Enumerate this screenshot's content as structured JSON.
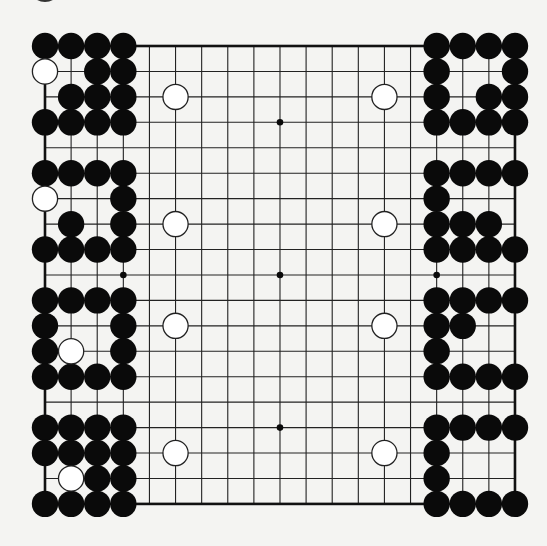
{
  "title": "Go board diagram",
  "board": {
    "size": 19,
    "background": "#f4f4f2",
    "line_color": "#222222",
    "edge_color": "#111111",
    "origin_x": 45,
    "origin_y": 46,
    "spacing_x": 26.11,
    "spacing_y": 25.44,
    "stone_radius": 13.2,
    "star_points": [
      [
        4,
        4
      ],
      [
        10,
        4
      ],
      [
        16,
        4
      ],
      [
        4,
        10
      ],
      [
        10,
        10
      ],
      [
        16,
        10
      ],
      [
        4,
        16
      ],
      [
        10,
        16
      ],
      [
        16,
        16
      ]
    ],
    "black_color": "#0a0a0a",
    "white_fill": "#ffffff",
    "white_stroke": "#222222"
  },
  "stones": {
    "black": [
      [
        1,
        1
      ],
      [
        2,
        1
      ],
      [
        3,
        1
      ],
      [
        4,
        1
      ],
      [
        3,
        2
      ],
      [
        4,
        2
      ],
      [
        2,
        3
      ],
      [
        3,
        3
      ],
      [
        4,
        3
      ],
      [
        1,
        4
      ],
      [
        2,
        4
      ],
      [
        3,
        4
      ],
      [
        4,
        4
      ],
      [
        1,
        6
      ],
      [
        2,
        6
      ],
      [
        3,
        6
      ],
      [
        4,
        6
      ],
      [
        4,
        7
      ],
      [
        2,
        8
      ],
      [
        4,
        8
      ],
      [
        1,
        9
      ],
      [
        2,
        9
      ],
      [
        3,
        9
      ],
      [
        4,
        9
      ],
      [
        1,
        11
      ],
      [
        2,
        11
      ],
      [
        3,
        11
      ],
      [
        4,
        11
      ],
      [
        1,
        12
      ],
      [
        4,
        12
      ],
      [
        1,
        13
      ],
      [
        4,
        13
      ],
      [
        1,
        14
      ],
      [
        2,
        14
      ],
      [
        3,
        14
      ],
      [
        4,
        14
      ],
      [
        1,
        16
      ],
      [
        2,
        16
      ],
      [
        3,
        16
      ],
      [
        4,
        16
      ],
      [
        1,
        17
      ],
      [
        2,
        17
      ],
      [
        3,
        17
      ],
      [
        4,
        17
      ],
      [
        3,
        18
      ],
      [
        4,
        18
      ],
      [
        1,
        19
      ],
      [
        2,
        19
      ],
      [
        3,
        19
      ],
      [
        4,
        19
      ],
      [
        16,
        1
      ],
      [
        17,
        1
      ],
      [
        18,
        1
      ],
      [
        19,
        1
      ],
      [
        16,
        2
      ],
      [
        19,
        2
      ],
      [
        16,
        3
      ],
      [
        18,
        3
      ],
      [
        19,
        3
      ],
      [
        16,
        4
      ],
      [
        17,
        4
      ],
      [
        18,
        4
      ],
      [
        19,
        4
      ],
      [
        16,
        6
      ],
      [
        17,
        6
      ],
      [
        18,
        6
      ],
      [
        19,
        6
      ],
      [
        16,
        7
      ],
      [
        16,
        8
      ],
      [
        17,
        8
      ],
      [
        18,
        8
      ],
      [
        16,
        9
      ],
      [
        17,
        9
      ],
      [
        18,
        9
      ],
      [
        19,
        9
      ],
      [
        16,
        11
      ],
      [
        17,
        11
      ],
      [
        18,
        11
      ],
      [
        19,
        11
      ],
      [
        16,
        12
      ],
      [
        17,
        12
      ],
      [
        16,
        13
      ],
      [
        16,
        14
      ],
      [
        17,
        14
      ],
      [
        18,
        14
      ],
      [
        19,
        14
      ],
      [
        16,
        16
      ],
      [
        17,
        16
      ],
      [
        18,
        16
      ],
      [
        19,
        16
      ],
      [
        16,
        17
      ],
      [
        16,
        18
      ],
      [
        16,
        19
      ],
      [
        17,
        19
      ],
      [
        18,
        19
      ],
      [
        19,
        19
      ]
    ],
    "white": [
      [
        1,
        2
      ],
      [
        1,
        7
      ],
      [
        2,
        13
      ],
      [
        2,
        18
      ],
      [
        6,
        3
      ],
      [
        14,
        3
      ],
      [
        6,
        8
      ],
      [
        14,
        8
      ],
      [
        6,
        12
      ],
      [
        14,
        12
      ],
      [
        6,
        17
      ],
      [
        14,
        17
      ]
    ]
  },
  "artifacts": {
    "partial_stone_top_left": {
      "cx": 45,
      "cy": -10,
      "rx": 14,
      "ry": 12
    }
  }
}
